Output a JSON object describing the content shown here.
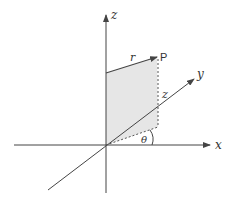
{
  "diagram": {
    "labels": {
      "z_axis": "z",
      "x_axis": "x",
      "y_axis": "y",
      "radius": "r",
      "point": "P",
      "height": "z",
      "angle": "θ"
    },
    "colors": {
      "line": "#444444",
      "shade": "#e6e6e6",
      "background": "#ffffff"
    }
  }
}
